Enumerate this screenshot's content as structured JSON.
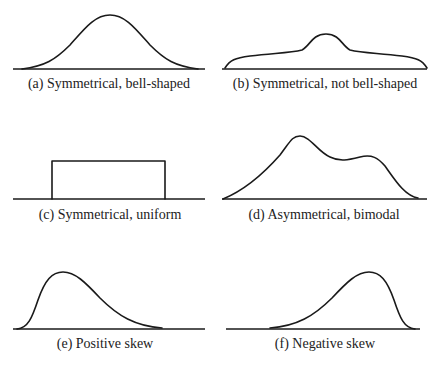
{
  "figure": {
    "panels": [
      {
        "id": "a",
        "caption": "(a) Symmetrical, bell-shaped",
        "shape": "bell"
      },
      {
        "id": "b",
        "caption": "(b) Symmetrical, not bell-shaped",
        "shape": "flat-with-central-bump"
      },
      {
        "id": "c",
        "caption": "(c) Symmetrical, uniform",
        "shape": "rectangle"
      },
      {
        "id": "d",
        "caption": "(d) Asymmetrical, bimodal",
        "shape": "two-peaks"
      },
      {
        "id": "e",
        "caption": "(e) Positive skew",
        "shape": "right-tail"
      },
      {
        "id": "f",
        "caption": "(f) Negative skew",
        "shape": "left-tail"
      }
    ],
    "colors": {
      "stroke": "#1a1a1a",
      "text": "#222222",
      "background": "#ffffff"
    }
  }
}
